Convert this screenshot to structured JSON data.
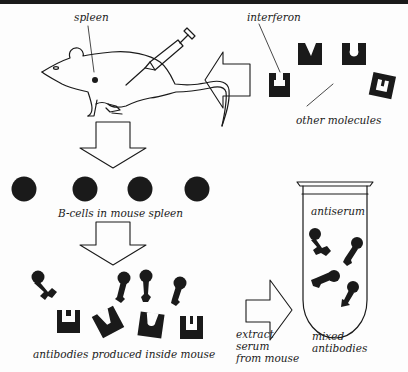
{
  "diagram": {
    "labels": {
      "spleen": "spleen",
      "interferon": "interferon",
      "other_molecules": "other molecules",
      "b_cells": "B-cells in mouse spleen",
      "antibodies_produced": "antibodies produced inside mouse",
      "antiserum": "antiserum",
      "extract_line1": "extract",
      "extract_line2": "serum",
      "extract_line3": "from mouse",
      "mixed_line1": "mixed",
      "mixed_line2": "antibodies"
    },
    "nodes": [
      {
        "id": "mouse",
        "label": "mouse injected with interferon"
      },
      {
        "id": "antigens",
        "label": "interferon + other molecules"
      },
      {
        "id": "bcells",
        "label": "B-cells in mouse spleen",
        "count": 4
      },
      {
        "id": "antibodies",
        "label": "antibodies produced inside mouse",
        "count": 4
      },
      {
        "id": "tube",
        "label": "antiserum / mixed antibodies",
        "count": 4
      }
    ],
    "edges": [
      {
        "from": "antigens",
        "to": "mouse",
        "direction": "left"
      },
      {
        "from": "mouse",
        "to": "bcells",
        "direction": "down"
      },
      {
        "from": "bcells",
        "to": "antibodies",
        "direction": "down"
      },
      {
        "from": "antibodies",
        "to": "tube",
        "direction": "right",
        "label": "extract serum from mouse"
      }
    ],
    "colors": {
      "ink": "#1a1a1a",
      "background": "#fdfdfd"
    }
  }
}
